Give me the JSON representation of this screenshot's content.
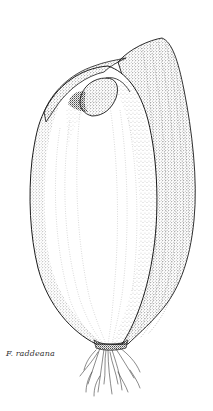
{
  "illustration": {
    "subject": "bulb",
    "caption": "F. raddeana",
    "style": "stipple line drawing",
    "colors": {
      "ink": "#1a1a1a",
      "background": "#ffffff",
      "caption": "#333333"
    }
  }
}
